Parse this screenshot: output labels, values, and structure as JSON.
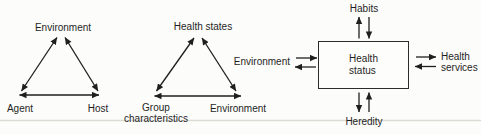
{
  "colors": {
    "ink": "#1f1f1f",
    "paper": "#fcfcfa",
    "divider": "#dcdcd7"
  },
  "triangle1": {
    "top": "Environment",
    "bottom_left": "Agent",
    "bottom_right": "Host"
  },
  "triangle2": {
    "top": "Health states",
    "bottom_left1": "Group",
    "bottom_left2": "characteristics",
    "bottom_right": "Environment"
  },
  "boxmodel": {
    "center1": "Health",
    "center2": "status",
    "top": "Habits",
    "left": "Environment",
    "right1": "Health",
    "right2": "services",
    "bottom": "Heredity"
  }
}
